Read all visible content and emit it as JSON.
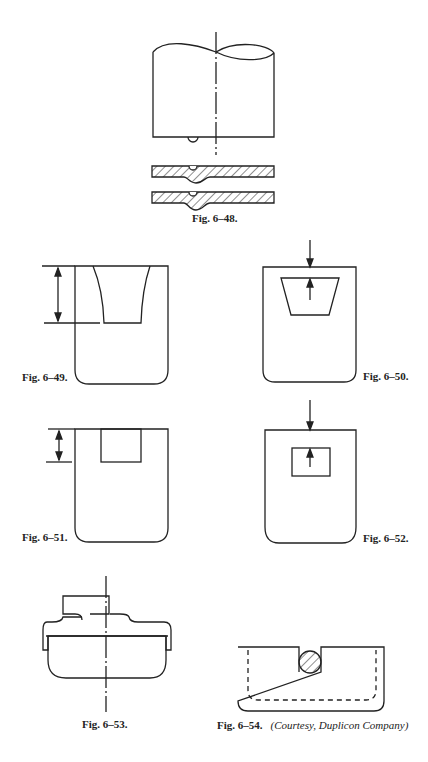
{
  "page": {
    "figures": [
      {
        "id": "fig-6-48",
        "caption": "Fig. 6–48."
      },
      {
        "id": "fig-6-49",
        "caption": "Fig. 6–49."
      },
      {
        "id": "fig-6-50",
        "caption": "Fig. 6–50."
      },
      {
        "id": "fig-6-51",
        "caption": "Fig. 6–51."
      },
      {
        "id": "fig-6-52",
        "caption": "Fig. 6–52."
      },
      {
        "id": "fig-6-53",
        "caption": "Fig. 6–53."
      },
      {
        "id": "fig-6-54",
        "caption": "Fig. 6–54.",
        "credit": "(Courtesy, Duplicon Company)"
      }
    ],
    "colors": {
      "ink": "#222222",
      "paper": "#ffffff"
    }
  }
}
